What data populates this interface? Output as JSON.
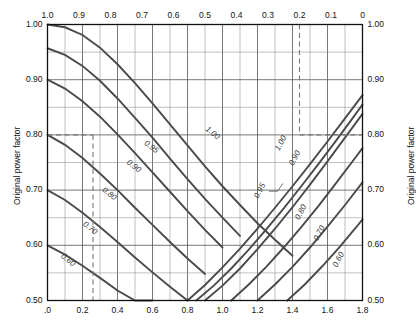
{
  "axes": {
    "left_title": "Original power factor",
    "right_title": "Original power factor",
    "left_ticks": [
      "1.00",
      "0.90",
      "0.80",
      "0.70",
      "0.60",
      "0.50"
    ],
    "left_tick_values": [
      1.0,
      0.9,
      0.8,
      0.7,
      0.6,
      0.5
    ],
    "right_ticks": [
      "1.00",
      "0.90",
      "0.80",
      "0.70",
      "0.60",
      "0.50"
    ],
    "right_tick_values": [
      1.0,
      0.9,
      0.8,
      0.7,
      0.6,
      0.5
    ],
    "bottom_ticks": [
      ".0",
      "0.2",
      "0.4",
      "0.6",
      "0.8",
      "1.0",
      "1.2",
      "1.4",
      "1.6",
      "1.8"
    ],
    "bottom_tick_values": [
      0.0,
      0.2,
      0.4,
      0.6,
      0.8,
      1.0,
      1.2,
      1.4,
      1.6,
      1.8
    ],
    "top_ticks": [
      "1.0",
      "0.9",
      "0.8",
      "0.7",
      "0.6",
      "0.5",
      "0.4",
      "0.3",
      "0.2",
      "0.1",
      "0"
    ],
    "top_tick_values": [
      1.0,
      0.9,
      0.8,
      0.7,
      0.6,
      0.5,
      0.4,
      0.3,
      0.2,
      0.1,
      0.0
    ]
  },
  "chart_data": {
    "type": "line",
    "title": "",
    "subtitle": "",
    "xlabel": "",
    "ylabel": "Original power factor",
    "xlim": [
      0.0,
      1.8
    ],
    "ylim": [
      0.5,
      1.0
    ],
    "top_axis_lim": [
      1.0,
      0.0
    ],
    "grid": true,
    "grid_x_step": 0.1,
    "grid_y_step": 0.05,
    "grid_x_major_step": 0.2,
    "grid_y_major_step": 0.1,
    "legend": "none",
    "annotations": [
      {
        "text": "dashed vertical at x = 0.26 from y = 0.80 down to y = 0.50"
      },
      {
        "text": "dashed horizontal at y = 0.80 from x = 0.0 to x = 0.26"
      },
      {
        "text": "dashed vertical at top-axis 0.2 (x = 1.65) from y = 1.00 down to y = 0.80"
      },
      {
        "text": "dashed horizontal at y = 0.80 from x = 1.65 to x = 1.8"
      },
      {
        "text": "leader line to the 0.95 label near x = 1.35, y = 0.695"
      }
    ],
    "series": [
      {
        "name": "desc-1.00",
        "label": "1.00",
        "direction": "descending",
        "label_at": {
          "x": 0.935,
          "y": 0.8
        },
        "x": [
          0.0,
          0.1,
          0.2,
          0.3,
          0.4,
          0.5,
          0.6,
          0.7,
          0.8,
          0.9,
          1.0,
          1.1,
          1.2,
          1.3,
          1.4
        ],
        "y": [
          1.0,
          0.995,
          0.981,
          0.958,
          0.928,
          0.894,
          0.857,
          0.819,
          0.781,
          0.743,
          0.707,
          0.673,
          0.64,
          0.61,
          0.581
        ]
      },
      {
        "name": "desc-0.95",
        "label": "0.95",
        "direction": "descending",
        "label_at": {
          "x": 0.585,
          "y": 0.775
        },
        "x": [
          0.0,
          0.1,
          0.2,
          0.3,
          0.4,
          0.5,
          0.6,
          0.7,
          0.8,
          0.9,
          1.0,
          1.1
        ],
        "y": [
          0.957,
          0.945,
          0.925,
          0.898,
          0.866,
          0.831,
          0.795,
          0.757,
          0.72,
          0.684,
          0.65,
          0.617
        ]
      },
      {
        "name": "desc-0.90",
        "label": "0.90",
        "direction": "descending",
        "label_at": {
          "x": 0.485,
          "y": 0.74
        },
        "x": [
          0.0,
          0.1,
          0.2,
          0.3,
          0.4,
          0.5,
          0.6,
          0.7,
          0.8,
          0.9,
          1.0
        ],
        "y": [
          0.9,
          0.884,
          0.861,
          0.833,
          0.801,
          0.767,
          0.732,
          0.697,
          0.662,
          0.628,
          0.596
        ]
      },
      {
        "name": "desc-0.80",
        "label": "0.80",
        "direction": "descending",
        "label_at": {
          "x": 0.345,
          "y": 0.69
        },
        "x": [
          0.0,
          0.1,
          0.2,
          0.3,
          0.4,
          0.5,
          0.6,
          0.7,
          0.8,
          0.9
        ],
        "y": [
          0.8,
          0.782,
          0.758,
          0.73,
          0.7,
          0.668,
          0.637,
          0.606,
          0.576,
          0.548
        ]
      },
      {
        "name": "desc-0.70",
        "label": "0.70",
        "direction": "descending",
        "label_at": {
          "x": 0.235,
          "y": 0.628
        },
        "x": [
          0.0,
          0.1,
          0.2,
          0.3,
          0.4,
          0.5,
          0.6,
          0.7,
          0.8
        ],
        "y": [
          0.7,
          0.682,
          0.659,
          0.633,
          0.606,
          0.578,
          0.551,
          0.525,
          0.5
        ]
      },
      {
        "name": "desc-0.60",
        "label": "0.60",
        "direction": "descending",
        "label_at": {
          "x": 0.11,
          "y": 0.57
        },
        "x": [
          0.0,
          0.1,
          0.2,
          0.3,
          0.4,
          0.5,
          0.6
        ],
        "y": [
          0.6,
          0.583,
          0.563,
          0.541,
          0.518,
          0.5,
          0.5
        ]
      },
      {
        "name": "asc-1.00",
        "label": "1.00",
        "direction": "ascending",
        "label_at": {
          "x": 1.345,
          "y": 0.783
        },
        "x": [
          0.8,
          0.9,
          1.0,
          1.1,
          1.2,
          1.3,
          1.4,
          1.5,
          1.6,
          1.7,
          1.8
        ],
        "y": [
          0.5,
          0.528,
          0.56,
          0.594,
          0.63,
          0.668,
          0.707,
          0.747,
          0.788,
          0.83,
          0.872
        ]
      },
      {
        "name": "asc-0.95",
        "label": "0.95",
        "direction": "ascending",
        "label_at": {
          "x": 1.225,
          "y": 0.697
        },
        "x": [
          0.85,
          0.95,
          1.05,
          1.15,
          1.25,
          1.35,
          1.45,
          1.55,
          1.65,
          1.75,
          1.8
        ],
        "y": [
          0.5,
          0.527,
          0.558,
          0.592,
          0.629,
          0.667,
          0.707,
          0.748,
          0.79,
          0.833,
          0.855
        ]
      },
      {
        "name": "asc-0.90",
        "label": "0.90",
        "direction": "ascending",
        "label_at": {
          "x": 1.425,
          "y": 0.756
        },
        "x": [
          0.9,
          1.0,
          1.1,
          1.2,
          1.3,
          1.4,
          1.5,
          1.6,
          1.7,
          1.8
        ],
        "y": [
          0.5,
          0.527,
          0.558,
          0.593,
          0.63,
          0.669,
          0.71,
          0.752,
          0.795,
          0.838
        ]
      },
      {
        "name": "asc-0.80",
        "label": "0.80",
        "direction": "ascending",
        "label_at": {
          "x": 1.46,
          "y": 0.658
        },
        "x": [
          1.05,
          1.15,
          1.25,
          1.35,
          1.45,
          1.55,
          1.65,
          1.75,
          1.8
        ],
        "y": [
          0.5,
          0.529,
          0.561,
          0.596,
          0.633,
          0.672,
          0.713,
          0.755,
          0.776
        ]
      },
      {
        "name": "asc-0.70",
        "label": "0.70",
        "direction": "ascending",
        "label_at": {
          "x": 1.565,
          "y": 0.62
        },
        "x": [
          1.2,
          1.3,
          1.4,
          1.5,
          1.6,
          1.7,
          1.8
        ],
        "y": [
          0.5,
          0.529,
          0.561,
          0.596,
          0.634,
          0.673,
          0.714
        ]
      },
      {
        "name": "asc-0.60",
        "label": "0.60",
        "direction": "ascending",
        "label_at": {
          "x": 1.675,
          "y": 0.572
        },
        "x": [
          1.37,
          1.47,
          1.57,
          1.67,
          1.77,
          1.8
        ],
        "y": [
          0.5,
          0.529,
          0.562,
          0.597,
          0.635,
          0.647
        ]
      }
    ]
  }
}
